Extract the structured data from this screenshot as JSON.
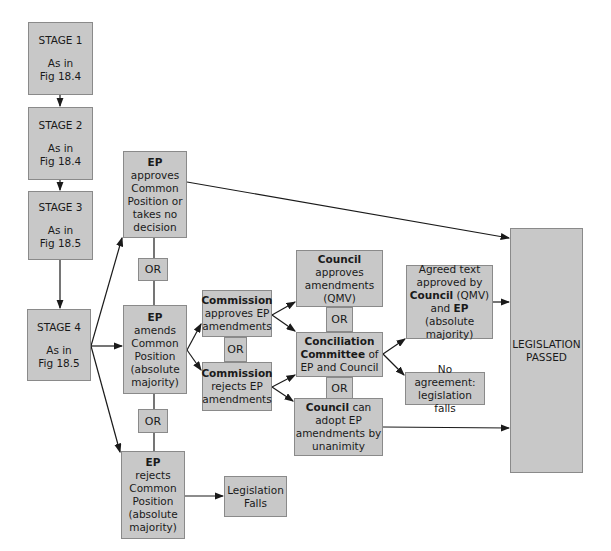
{
  "diagram": {
    "stages": [
      {
        "id": "stage1",
        "title": "STAGE 1",
        "line1": "As in",
        "line2": "Fig 18.4"
      },
      {
        "id": "stage2",
        "title": "STAGE 2",
        "line1": "As in",
        "line2": "Fig 18.4"
      },
      {
        "id": "stage3",
        "title": "STAGE 3",
        "line1": "As in",
        "line2": "Fig 18.5"
      },
      {
        "id": "stage4",
        "title": "STAGE 4",
        "line1": "As in",
        "line2": "Fig 18.5"
      }
    ],
    "ep_approves": {
      "bold": "EP",
      "lines": [
        "approves",
        "Common",
        "Position or",
        "takes no",
        "decision"
      ]
    },
    "ep_amends": {
      "bold": "EP",
      "lines": [
        "amends",
        "Common",
        "Position",
        "(absolute",
        "majority)"
      ]
    },
    "ep_rejects": {
      "bold": "EP",
      "lines": [
        "rejects",
        "Common",
        "Position",
        "(absolute",
        "majority)"
      ]
    },
    "or_label": "OR",
    "legislation_falls": {
      "lines": [
        "Legislation",
        "Falls"
      ]
    },
    "commission_approves": {
      "bold": "Commission",
      "lines": [
        "approves EP",
        "amendments"
      ]
    },
    "commission_rejects": {
      "bold": "Commission",
      "lines": [
        "rejects EP",
        "amendments"
      ]
    },
    "council_approves": {
      "bold": "Council",
      "lines": [
        "approves",
        "amendments",
        "(QMV)"
      ]
    },
    "conciliation": {
      "bold1": "Conciliation",
      "bold2": "Committee",
      "rest2": " of",
      "line3": "EP and Council"
    },
    "council_adopt": {
      "bold": "Council",
      "rest1": " can",
      "lines": [
        "adopt EP",
        "amendments by",
        "unanimity"
      ]
    },
    "agreed_text": {
      "line1": "Agreed text",
      "line2": "approved by",
      "bold3": "Council",
      "rest3": " (QMV)",
      "pre4": "and ",
      "bold4": "EP",
      "rest4": " (absolute",
      "line5": "majority)"
    },
    "no_agreement": {
      "lines": [
        "No agreement:",
        "legislation falls"
      ]
    },
    "legislation_passed": {
      "lines": [
        "LEGISLATION",
        "PASSED"
      ]
    }
  },
  "colors": {
    "box_fill": "#c8c8c8",
    "box_border": "#8a8a8a",
    "line": "#1a1a1a"
  }
}
